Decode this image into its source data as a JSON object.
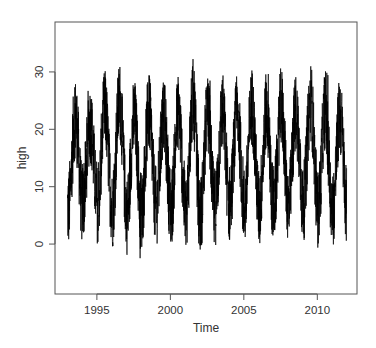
{
  "chart_data": {
    "type": "line",
    "title": "",
    "xlabel": "Time",
    "ylabel": "high",
    "x_range": [
      1993.0,
      2012.0
    ],
    "xlim": [
      1992.15,
      2012.7
    ],
    "ylim": [
      -8.7,
      38.7
    ],
    "x_ticks": [
      1995,
      2000,
      2005,
      2010
    ],
    "x_tick_labels": [
      "1995",
      "2000",
      "2005",
      "2010"
    ],
    "y_ticks": [
      0,
      10,
      20,
      30
    ],
    "y_tick_labels": [
      "0",
      "10",
      "20",
      "30"
    ],
    "grid": false,
    "legend": null,
    "frequency": "daily",
    "seasonality": "annual (peaks mid-year, troughs near January)",
    "series": [
      {
        "name": "high",
        "color": "#000000",
        "yearly_summary": {
          "years": [
            1993,
            1994,
            1995,
            1996,
            1997,
            1998,
            1999,
            2000,
            2001,
            2002,
            2003,
            2004,
            2005,
            2006,
            2007,
            2008,
            2009,
            2010,
            2011
          ],
          "summer_max": [
            28.5,
            27.5,
            30.0,
            35.5,
            28.0,
            30.0,
            28.5,
            30.0,
            33.5,
            28.5,
            30.5,
            29.5,
            32.5,
            31.0,
            32.0,
            30.5,
            36.5,
            30.5,
            30.0
          ],
          "summer_mean": [
            22.0,
            21.0,
            23.5,
            25.0,
            22.0,
            23.0,
            22.0,
            23.0,
            24.5,
            22.5,
            23.0,
            22.5,
            24.0,
            23.0,
            24.0,
            23.0,
            25.0,
            23.5,
            22.5
          ],
          "winter_min": [
            -7.0,
            2.0,
            2.5,
            1.5,
            -3.5,
            -1.5,
            -0.5,
            -0.5,
            0.0,
            -2.0,
            1.5,
            3.0,
            2.0,
            1.0,
            3.0,
            2.0,
            3.0,
            2.0,
            1.5
          ],
          "winter_mean": [
            6.0,
            7.5,
            7.0,
            6.0,
            5.0,
            6.0,
            6.5,
            6.0,
            5.5,
            5.0,
            6.5,
            7.0,
            6.5,
            6.0,
            7.0,
            6.5,
            7.0,
            6.0,
            6.0
          ]
        },
        "end_value_approx": 8.0
      }
    ]
  }
}
